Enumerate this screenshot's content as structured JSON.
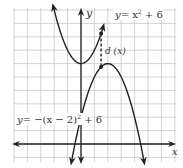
{
  "diagram": {
    "type": "function-graph",
    "axes": {
      "x_label": "x",
      "y_label": "y"
    },
    "grid": {
      "x_min": -5,
      "x_max": 7,
      "y_min": -1,
      "y_max": 10,
      "step": 1
    },
    "curves": [
      {
        "name": "upper-parabola",
        "equation_label": "y = x² + 6",
        "eq_lhs": "y",
        "eq_rhs_base": "= x",
        "eq_exp": "2",
        "eq_tail": " + 6",
        "vertex": [
          0,
          6
        ]
      },
      {
        "name": "lower-parabola",
        "equation_label": "y = −(x − 2)² + 6",
        "eq_lhs": "y",
        "eq_rhs_base": "= −(x − 2)",
        "eq_exp": "2",
        "eq_tail": " + 6",
        "vertex": [
          2,
          6
        ]
      }
    ],
    "distance_label": "d (x)",
    "distance_at_x": 1.5,
    "colors": {
      "grid": "#c8c8c8",
      "curve": "#222222",
      "axis": "#222222"
    }
  }
}
